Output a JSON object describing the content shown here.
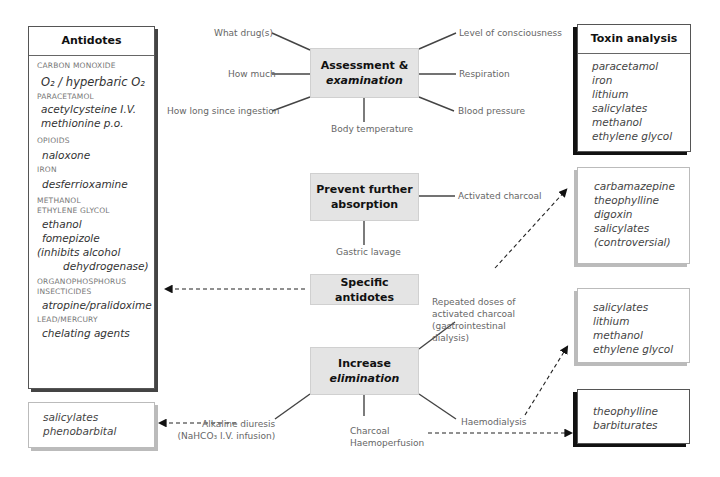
{
  "center": {
    "assessment": {
      "line1": "Assessment &",
      "line2": "examination"
    },
    "prevent": {
      "line1": "Prevent further",
      "line2": "absorption"
    },
    "antidotes": {
      "label": "Specific antidotes"
    },
    "elimination": {
      "line1": "Increase",
      "line2": "elimination"
    }
  },
  "assessment_labels": {
    "what_drug": "What drug(s)",
    "how_much": "How much",
    "how_long": "How long since ingestion",
    "body_temp": "Body temperature",
    "consciousness": "Level of consciousness",
    "respiration": "Respiration",
    "blood_pressure": "Blood pressure"
  },
  "prevent_labels": {
    "charcoal": "Activated charcoal",
    "lavage": "Gastric lavage"
  },
  "elimination_labels": {
    "repeated": [
      "Repeated doses of",
      "activated charcoal",
      "(gastrointestinal",
      "dialysis)"
    ],
    "alkaline": [
      "Alkaline diuresis",
      "(NaHCO₃ I.V. infusion)"
    ],
    "haemoperfusion": [
      "Charcoal",
      "Haemoperfusion"
    ],
    "haemodialysis": "Haemodialysis"
  },
  "antidotes_box": {
    "title": "Antidotes",
    "groups": [
      {
        "category": [
          "CARBON MONOXIDE"
        ],
        "drugs": [
          "O₂ / hyperbaric O₂"
        ]
      },
      {
        "category": [
          "PARACETAMOL"
        ],
        "drugs": [
          "acetylcysteine I.V.",
          "methionine p.o."
        ]
      },
      {
        "category": [
          "OPIOIDS"
        ],
        "drugs": [
          "naloxone"
        ]
      },
      {
        "category": [
          "IRON"
        ],
        "drugs": [
          "desferrioxamine"
        ]
      },
      {
        "category": [
          "METHANOL",
          "ETHYLENE GLYCOL"
        ],
        "drugs": [
          "ethanol",
          "fomepizole",
          "(inhibits alcohol",
          "dehydrogenase)"
        ]
      },
      {
        "category": [
          "ORGANOPHOSPHORUS",
          "INSECTICIDES"
        ],
        "drugs": [
          "atropine/pralidoxime"
        ]
      },
      {
        "category": [
          "LEAD/MERCURY"
        ],
        "drugs": [
          "chelating agents"
        ]
      }
    ]
  },
  "alkaline_box": {
    "items": [
      "salicylates",
      "phenobarbital"
    ]
  },
  "toxin_box": {
    "title": "Toxin analysis",
    "items": [
      "paracetamol",
      "iron",
      "lithium",
      "salicylates",
      "methanol",
      "ethylene glycol"
    ]
  },
  "charcoal_box": {
    "items": [
      "carbamazepine",
      "theophylline",
      "digoxin",
      "salicylates",
      "(controversial)"
    ]
  },
  "dialysis_box": {
    "items": [
      "salicylates",
      "lithium",
      "methanol",
      "ethylene glycol"
    ]
  },
  "perfusion_box": {
    "items": [
      "theophylline",
      "barbiturates"
    ]
  }
}
